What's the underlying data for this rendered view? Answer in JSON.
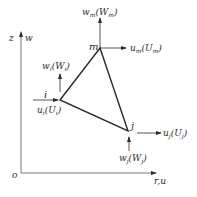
{
  "diagram": {
    "type": "triangular-element-axisymmetric",
    "colors": {
      "line": "#2a2a2a",
      "axis": "#555555",
      "background": "#ffffff"
    },
    "axes": {
      "vertical": {
        "label_coord": "z",
        "label_disp": "w"
      },
      "horizontal": {
        "label": "r,u"
      },
      "origin": "o"
    },
    "nodes": [
      {
        "id": "i",
        "label": "i",
        "w_label": "w",
        "w_sub": "i",
        "W_label": "W",
        "W_sub": "i",
        "u_label": "u",
        "u_sub": "i",
        "U_label": "U",
        "U_sub": "i"
      },
      {
        "id": "j",
        "label": "j",
        "w_label": "w",
        "w_sub": "j",
        "W_label": "W",
        "W_sub": "j",
        "u_label": "u",
        "u_sub": "j",
        "U_label": "U",
        "U_sub": "j"
      },
      {
        "id": "m",
        "label": "m",
        "w_label": "w",
        "w_sub": "m",
        "W_label": "W",
        "W_sub": "m",
        "u_label": "u",
        "u_sub": "m",
        "U_label": "U",
        "U_sub": "m"
      }
    ]
  }
}
